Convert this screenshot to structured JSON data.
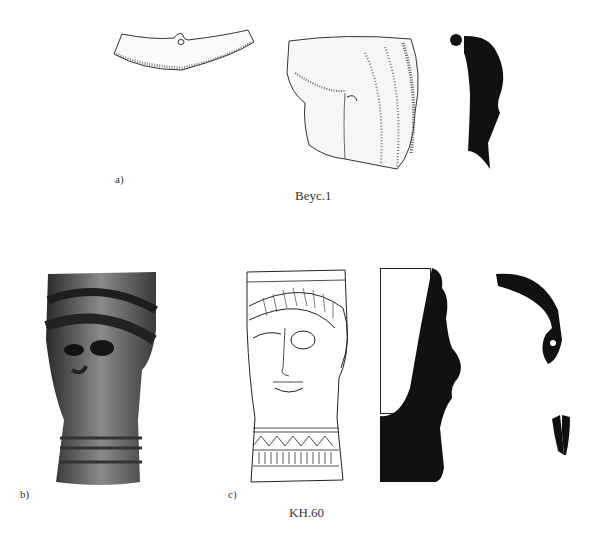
{
  "figure": {
    "row1": {
      "panel_label": "a)",
      "caption": "Beyc.1",
      "items": [
        "pendant-fragment-drawing",
        "head-fragment-drawing",
        "head-fragment-section-profile"
      ]
    },
    "row2": {
      "panel_labels": [
        "b)",
        "c)"
      ],
      "caption": "KH.60",
      "items": [
        "head-vessel-photograph",
        "head-vessel-drawing",
        "head-vessel-section-profile",
        "ear-ornament-section",
        "small-fragment-section"
      ]
    }
  }
}
